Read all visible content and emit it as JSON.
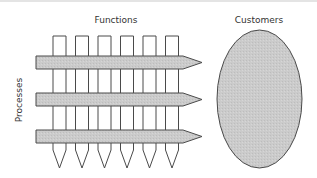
{
  "diagram": {
    "labels": {
      "functions": "Functions",
      "customers": "Customers",
      "processes": "Processes"
    },
    "function_columns": 6,
    "process_arrows": 3,
    "colors": {
      "stroke": "#4a4a4a",
      "fill": "#c8c8c8",
      "column_fill": "#ffffff",
      "text": "#333333"
    }
  }
}
